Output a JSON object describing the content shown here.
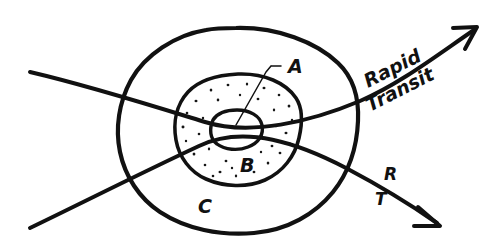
{
  "diagram": {
    "background_color": "#ffffff",
    "ink_color": "#111111",
    "zones": [
      {
        "id": "A",
        "label": "A",
        "description": "innermost core circle",
        "fill": "none",
        "label_x": 290,
        "label_y": 72
      },
      {
        "id": "B",
        "label": "B",
        "description": "middle stippled ring",
        "fill": "stipple",
        "label_x": 243,
        "label_y": 171
      },
      {
        "id": "C",
        "label": "C",
        "description": "outer ring",
        "fill": "none",
        "label_x": 201,
        "label_y": 212
      }
    ],
    "routes": [
      {
        "id": "rapid-transit-upper",
        "label": "Rapid",
        "label2": "Transit",
        "arrow": "up-right"
      },
      {
        "id": "rapid-transit-lower",
        "label_top": "R",
        "label_bottom": "T",
        "arrow": "down-right"
      }
    ],
    "leader": {
      "from_label": "A",
      "to_zone": "A"
    }
  }
}
